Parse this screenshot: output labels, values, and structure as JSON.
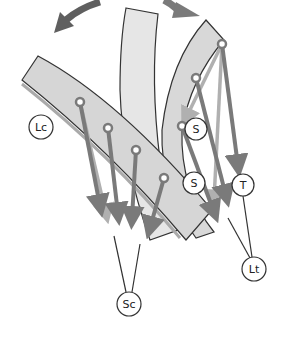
{
  "diagram": {
    "colors": {
      "background": "#ffffff",
      "band_fill": "#dcdcdc",
      "band_fill_light": "#e8e8e8",
      "band_stroke": "#333333",
      "rotation_arrow": "#5f5f5f",
      "force_arrow_dark": "#7a7a7a",
      "force_arrow_light": "#b0b0b0",
      "anchor_fill": "#ffffff",
      "anchor_stroke": "#7a7a7a",
      "label_stroke": "#333333"
    },
    "labels": [
      {
        "id": "Lc",
        "text": "Lc",
        "x": 41,
        "y": 127
      },
      {
        "id": "S1",
        "text": "S",
        "x": 196,
        "y": 129
      },
      {
        "id": "S2",
        "text": "S",
        "x": 194,
        "y": 183
      },
      {
        "id": "T",
        "text": "T",
        "x": 243,
        "y": 185
      },
      {
        "id": "Lt",
        "text": "Lt",
        "x": 254,
        "y": 269
      },
      {
        "id": "Sc",
        "text": "Sc",
        "x": 129,
        "y": 304
      }
    ],
    "rotation_arrows": [
      {
        "id": "left-rotation",
        "direction": "counter-clockwise"
      },
      {
        "id": "right-rotation",
        "direction": "clockwise"
      }
    ]
  }
}
